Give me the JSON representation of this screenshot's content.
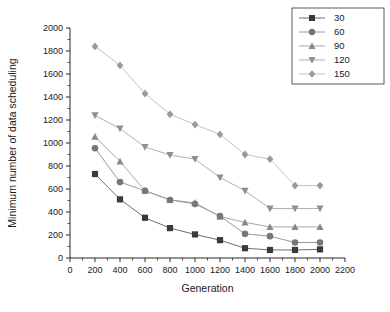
{
  "chart_data": {
    "type": "line",
    "title": "",
    "xlabel": "Generation",
    "ylabel": "Minimum number of data scheduling",
    "xlim": [
      0,
      2200
    ],
    "ylim": [
      0,
      2000
    ],
    "xticks": [
      0,
      200,
      400,
      600,
      800,
      1000,
      1200,
      1400,
      1600,
      1800,
      2000,
      2200
    ],
    "yticks": [
      0,
      200,
      400,
      600,
      800,
      1000,
      1200,
      1400,
      1600,
      1800,
      2000
    ],
    "grid": false,
    "legend_position": "top-right",
    "x": [
      200,
      400,
      600,
      800,
      1000,
      1200,
      1400,
      1600,
      1800,
      2000
    ],
    "series": [
      {
        "name": "30",
        "marker": "square",
        "color": "#3a3a3a",
        "line_color": "#6e6e6e",
        "values": [
          730,
          510,
          350,
          260,
          205,
          155,
          85,
          70,
          70,
          75
        ]
      },
      {
        "name": "60",
        "marker": "circle",
        "color": "#777777",
        "line_color": "#9a9a9a",
        "values": [
          955,
          660,
          585,
          505,
          470,
          365,
          210,
          190,
          135,
          135
        ]
      },
      {
        "name": "90",
        "marker": "triangle-up",
        "color": "#8a8a8a",
        "line_color": "#a8a8a8",
        "values": [
          1055,
          840,
          585,
          505,
          480,
          360,
          310,
          270,
          270,
          270
        ]
      },
      {
        "name": "120",
        "marker": "triangle-down",
        "color": "#8f8f8f",
        "line_color": "#b0b0b0",
        "values": [
          1240,
          1125,
          965,
          895,
          860,
          700,
          585,
          430,
          430,
          430
        ]
      },
      {
        "name": "150",
        "marker": "diamond",
        "color": "#9a9a9a",
        "line_color": "#c4c4c4",
        "values": [
          1840,
          1675,
          1430,
          1250,
          1160,
          1075,
          900,
          860,
          630,
          630
        ]
      }
    ]
  },
  "legend": {
    "items": [
      {
        "label": "30"
      },
      {
        "label": "60"
      },
      {
        "label": "90"
      },
      {
        "label": "120"
      },
      {
        "label": "150"
      }
    ]
  },
  "axes": {
    "x_title": "Generation",
    "y_title": "Minimum number of data scheduling",
    "x_tick_labels": [
      "0",
      "200",
      "400",
      "600",
      "800",
      "1000",
      "1200",
      "1400",
      "1600",
      "1800",
      "2000",
      "2200"
    ],
    "y_tick_labels": [
      "0",
      "200",
      "400",
      "600",
      "800",
      "1000",
      "1200",
      "1400",
      "1600",
      "1800",
      "2000"
    ]
  },
  "caption": {
    "text": ""
  }
}
